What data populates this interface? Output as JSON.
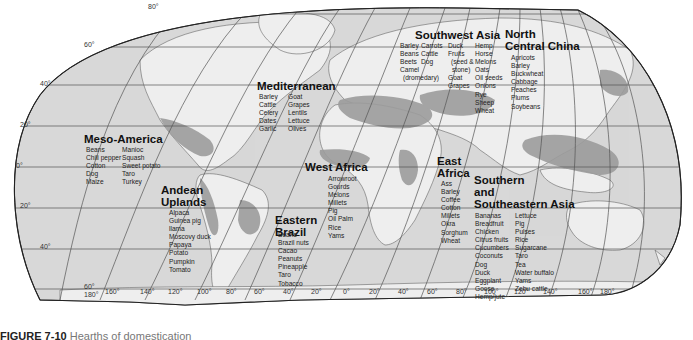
{
  "map": {
    "title": "World hearths of domestication",
    "latitude_labels": [
      "80°",
      "60°",
      "40°",
      "20°",
      "0°",
      "20°",
      "40°",
      "60°"
    ],
    "longitude_labels": [
      "180°",
      "160°",
      "140°",
      "120°",
      "100°",
      "80°",
      "60°",
      "40°",
      "20°",
      "0°",
      "20°",
      "40°",
      "60°",
      "80°",
      "100°",
      "120°",
      "140°",
      "160°",
      "180°"
    ],
    "colors": {
      "ocean": "#d9d9d9",
      "land": "#ececec",
      "hearth": "#9a9a9a",
      "grid": "#555555",
      "border": "#666666"
    }
  },
  "regions": {
    "meso_america": {
      "name": "Meso-America",
      "col1": [
        "Beans",
        "Chili pepper",
        "Cotton",
        "Dog",
        "Maize"
      ],
      "col2": [
        "Manioc",
        "Squash",
        "Sweet potato",
        "Taro",
        "Turkey"
      ]
    },
    "andean": {
      "name_line1": "Andean",
      "name_line2": "Uplands",
      "items": [
        "Alpaca",
        "Guinea pig",
        "llama",
        "Moscovy duck",
        "Papaya",
        "Potato",
        "Pumpkin",
        "Tomato"
      ]
    },
    "eastern_brazil": {
      "name_line1": "Eastern",
      "name_line2": "Brazil",
      "items": [
        "Beans",
        "Brazil nuts",
        "Cacao",
        "Peanuts",
        "Pineapple",
        "Taro",
        "Tobacco"
      ]
    },
    "mediterranean": {
      "name": "Mediterranean",
      "col1": [
        "Barley",
        "Cattle",
        "Celery",
        "Dates",
        "Garlic"
      ],
      "col2": [
        "Goat",
        "Grapes",
        "Lentils",
        "Lettuce",
        "Olives"
      ]
    },
    "west_africa": {
      "name": "West Africa",
      "items": [
        "Arrowroot",
        "Gourds",
        "Melons",
        "Millets",
        "Pig",
        "Oil Palm",
        "Rice",
        "Yams"
      ]
    },
    "east_africa": {
      "name_line1": "East",
      "name_line2": "Africa",
      "items": [
        "Ass",
        "Barley",
        "Coffee",
        "Cotton",
        "Millets",
        "Okra",
        "Sorghum",
        "Wheat"
      ]
    },
    "southwest_asia": {
      "name": "Southwest Asia",
      "col1": [
        "Barley",
        "Beans",
        "Beets",
        "Camel",
        "(dromedary)"
      ],
      "col2": [
        "Carrots",
        "Cattle",
        "Dog"
      ],
      "col3": [
        "Duck",
        "Fruits",
        "(seed &",
        "stone)",
        "Goat",
        "Grapes"
      ],
      "col4": [
        "Hemp",
        "Horse",
        "Melons",
        "Oats",
        "Oil seeds",
        "Onions",
        "Rye",
        "Sheep",
        "Wheat"
      ]
    },
    "north_central_china": {
      "name_line1": "North",
      "name_line2": "Central China",
      "items": [
        "Apricots",
        "Barley",
        "Buckwheat",
        "Cabbage",
        "Peaches",
        "Plums",
        "Soybeans"
      ]
    },
    "southeast_asia": {
      "name_line1": "Southern",
      "name_line2": "and",
      "name_line3": "Southeastern Asia",
      "col1": [
        "Bananas",
        "Breadfruit",
        "Chicken",
        "Citrus fruits",
        "Cucumbers",
        "Coconuts",
        "Dog",
        "Duck",
        "Eggplant",
        "Goose",
        "Hemp/jute"
      ],
      "col2": [
        "Lettuce",
        "Pig",
        "Pulses",
        "Rice",
        "Sugarcane",
        "Taro",
        "Tea",
        "Water buffalo",
        "Yams",
        "Zebu cattle"
      ]
    }
  },
  "caption": {
    "figure": "FIGURE 7-10",
    "text": "Hearths of domestication"
  }
}
